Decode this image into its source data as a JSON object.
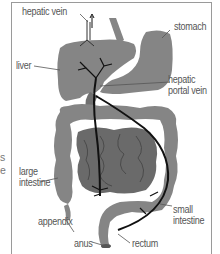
{
  "diagram": {
    "colors": {
      "organ": "#858585",
      "small_intestine": "#6a6a6a",
      "vessel": "#111111",
      "label_text": "#555555",
      "frame": "#9a9a9a"
    },
    "labels": {
      "hepatic_vein": "hepatic vein",
      "stomach": "stomach",
      "liver": "liver",
      "hepatic_portal_vein_line1": "hepatic",
      "hepatic_portal_vein_line2": "portal vein",
      "large_intestine_line1": "large",
      "large_intestine_line2": "intestine",
      "appendix": "appendix",
      "small_intestine_line1": "small",
      "small_intestine_line2": "intestine",
      "anus": "anus",
      "rectum": "rectum"
    },
    "cropped_edge_text": [
      "s",
      "e"
    ]
  }
}
